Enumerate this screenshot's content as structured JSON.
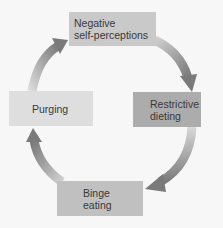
{
  "diagram": {
    "type": "cycle",
    "direction": "clockwise",
    "nodes": [
      {
        "id": "negative",
        "lines": [
          "Negative",
          "self-perceptions"
        ],
        "color": "#c9c9c9"
      },
      {
        "id": "restrictive",
        "lines": [
          "Restrictive",
          "dieting"
        ],
        "color": "#acacac"
      },
      {
        "id": "binge",
        "lines": [
          "Binge",
          "eating"
        ],
        "color": "#c0c0c0"
      },
      {
        "id": "purging",
        "lines": [
          "Purging"
        ],
        "color": "#dedede"
      }
    ],
    "edges": [
      {
        "from": "negative",
        "to": "restrictive"
      },
      {
        "from": "restrictive",
        "to": "binge"
      },
      {
        "from": "binge",
        "to": "purging"
      },
      {
        "from": "purging",
        "to": "negative"
      }
    ],
    "arrow_color": "#8a8a8a"
  }
}
